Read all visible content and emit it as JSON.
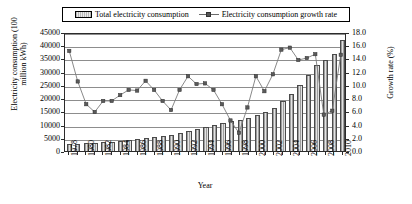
{
  "legend": {
    "bar_label": "Total electricity consumption",
    "line_label": "Electricity consumption growth rate",
    "bar_swatch_icon": "bar-swatch-icon",
    "line_swatch_icon": "line-marker-swatch-icon"
  },
  "chart_data": {
    "type": "bar",
    "title": "",
    "xlabel": "Year",
    "ylabel": "Electricity consumption (100 million kWh)",
    "y2label": "Growth rate (%)",
    "grid": true,
    "legend_position": "top",
    "ylim": [
      0,
      45000
    ],
    "y2lim": [
      0,
      18.0
    ],
    "yticks": [
      0,
      5000,
      10000,
      15000,
      20000,
      25000,
      30000,
      35000,
      40000,
      45000
    ],
    "ytick_labels": [
      "0",
      "5000",
      "10000",
      "15000",
      "20000",
      "25000",
      "30000",
      "35000",
      "40000",
      "45000"
    ],
    "y2ticks": [
      0.0,
      2.0,
      4.0,
      6.0,
      8.0,
      10.0,
      12.0,
      14.0,
      16.0,
      18.0
    ],
    "y2tick_labels": [
      "0.0",
      "2.0",
      "4.0",
      "6.0",
      "8.0",
      "10.0",
      "12.0",
      "14.0",
      "16.0",
      "18.0"
    ],
    "categories": [
      1978,
      1979,
      1980,
      1981,
      1982,
      1983,
      1984,
      1985,
      1986,
      1987,
      1988,
      1989,
      1990,
      1991,
      1992,
      1993,
      1994,
      1995,
      1996,
      1997,
      1998,
      1999,
      2000,
      2001,
      2002,
      2003,
      2004,
      2005,
      2006,
      2007,
      2008,
      2009,
      2010
    ],
    "xtick_labels": [
      "1978",
      "1980",
      "1982",
      "1984",
      "1986",
      "1988",
      "1990",
      "1992",
      "1994",
      "1996",
      "1998",
      "2000",
      "2002",
      "2004",
      "2006",
      "2008",
      "2010"
    ],
    "series": [
      {
        "name": "Total electricity consumption",
        "axis": "left",
        "unit": "100 million kWh",
        "type": "bar",
        "values": [
          2498,
          2820,
          3006,
          3093,
          3270,
          3490,
          3770,
          4095,
          4456,
          4973,
          5439,
          5867,
          6230,
          6800,
          7595,
          8426,
          9260,
          10023,
          10764,
          11284,
          11598,
          12305,
          13472,
          14634,
          16331,
          18910,
          21735,
          24940,
          28588,
          32712,
          34541,
          36595,
          41923
        ]
      },
      {
        "name": "Electricity consumption growth rate",
        "axis": "right",
        "unit": "%",
        "type": "line",
        "marker": "square",
        "values": [
          15.4,
          10.7,
          7.2,
          6.0,
          7.7,
          7.7,
          8.6,
          9.4,
          9.3,
          10.8,
          9.4,
          7.7,
          6.3,
          9.4,
          11.5,
          10.3,
          10.4,
          9.4,
          7.2,
          4.7,
          2.8,
          6.7,
          11.5,
          9.2,
          11.8,
          15.6,
          15.9,
          14.0,
          14.3,
          14.9,
          5.6,
          6.2,
          14.8
        ]
      }
    ]
  }
}
